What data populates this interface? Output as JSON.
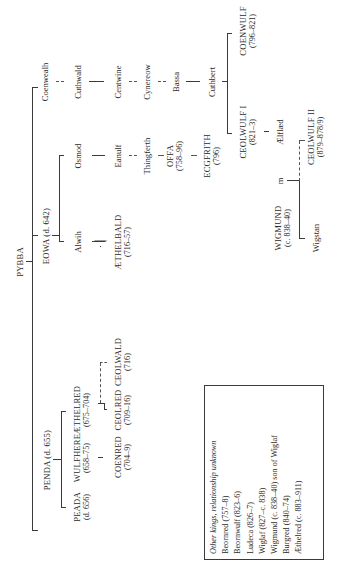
{
  "root": {
    "name": "PYBBA"
  },
  "branches": {
    "penda": {
      "name": "PENDA (d. 655)",
      "children": [
        {
          "name": "PEADA",
          "dates": "(d. 656)"
        },
        {
          "name": "WULFHERE",
          "dates": "(658–75)"
        },
        {
          "name": "ÆTHELRED",
          "dates": "(675–704)"
        }
      ],
      "grandchildren": [
        {
          "name": "COENRED",
          "dates": "(704–9)"
        },
        {
          "name": "CEOLRED",
          "dates": "(709–16)"
        },
        {
          "name": "CEOLWALD",
          "dates": "(716)"
        }
      ]
    },
    "eowa": {
      "name": "EOWA (d. 642)",
      "children": [
        {
          "name": "Alwih"
        },
        {
          "name": "Osmod"
        }
      ],
      "alwih_line": [
        {
          "name": "ÆTHELBALD",
          "dates": "(716–57)"
        }
      ],
      "osmod_line": [
        {
          "name": "Eanulf"
        },
        {
          "name": "Thingferth"
        },
        {
          "name": "OFFA",
          "dates": "(758–96)"
        },
        {
          "name": "ECGFRITH",
          "dates": "(796)"
        }
      ]
    },
    "coenwealh": {
      "name": "Coenwealh",
      "line": [
        {
          "name": "Cuthwald"
        },
        {
          "name": "Centwine"
        },
        {
          "name": "Cynereow"
        },
        {
          "name": "Bassa"
        },
        {
          "name": "Cuthbert"
        }
      ],
      "cuthbert_children": [
        {
          "name": "CEOLWULF I",
          "dates": "(821–3)"
        },
        {
          "name": "COENWULF",
          "dates": "(796–821)"
        }
      ],
      "aelflaed": {
        "name": "Ælflæd"
      },
      "marriage_marker": "m",
      "wigmund": {
        "name": "WIGMUND",
        "dates": "(c. 838–40)"
      },
      "wigstan": {
        "name": "Wigstan"
      },
      "ceolwulf2": {
        "name": "CEOLWULF II",
        "dates": "(879–878/9)"
      }
    }
  },
  "legend": {
    "title": "Other kings, relationship unknown",
    "items": [
      "Beornred (757–8)",
      "Beornwulf (823–6)",
      "Ludeca (826–7)",
      "Wiglaf (827–c. 838)",
      "Wigmund (c. 838–40) son of Wiglaf",
      "Burgred (840–74)",
      "Æthelred (c. 883–911)"
    ]
  }
}
